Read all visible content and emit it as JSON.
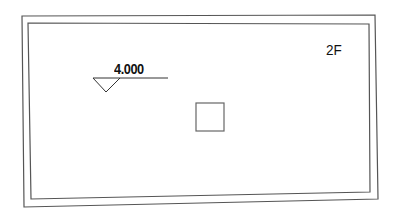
{
  "drawing": {
    "elevation_marker": {
      "value": "4.000"
    },
    "floor_label": "2F",
    "colors": {
      "line": "#555555",
      "text": "#111111",
      "background": "#ffffff"
    }
  }
}
